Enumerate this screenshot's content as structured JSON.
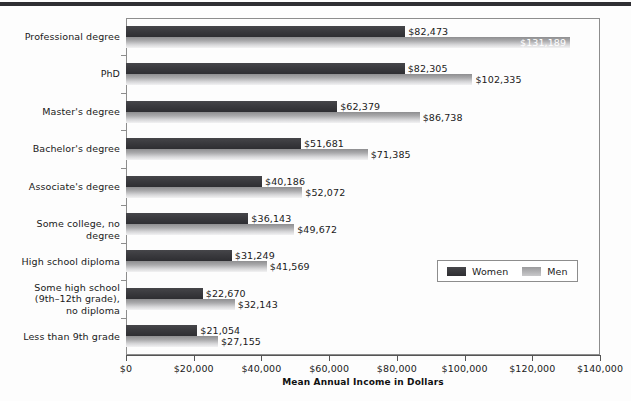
{
  "chart_data": {
    "type": "bar",
    "orientation": "horizontal",
    "title": "",
    "xlabel": "Mean Annual Income in Dollars",
    "ylabel": "",
    "xlim": [
      0,
      140000
    ],
    "xticks": [
      0,
      20000,
      40000,
      60000,
      80000,
      100000,
      120000,
      140000
    ],
    "xtick_labels": [
      "$0",
      "$20,000",
      "$40,000",
      "$60,000",
      "$80,000",
      "$100,000",
      "$120,000",
      "$140,000"
    ],
    "grid": false,
    "legend_position": "inside-lower-right",
    "categories": [
      "Professional degree",
      "PhD",
      "Master's degree",
      "Bachelor's degree",
      "Associate's degree",
      "Some college, no degree",
      "High school diploma",
      "Some high school (9th–12th grade), no diploma",
      "Less than 9th grade"
    ],
    "category_label_lines": [
      [
        "Professional degree"
      ],
      [
        "PhD"
      ],
      [
        "Master's degree"
      ],
      [
        "Bachelor's degree"
      ],
      [
        "Associate's degree"
      ],
      [
        "Some college, no degree"
      ],
      [
        "High school diploma"
      ],
      [
        "Some high school",
        "(9th–12th grade),",
        "no diploma"
      ],
      [
        "Less than 9th grade"
      ]
    ],
    "series": [
      {
        "name": "Women",
        "color": "#3a3a3e",
        "values": [
          82473,
          82305,
          62379,
          51681,
          40186,
          36143,
          31249,
          22670,
          21054
        ],
        "data_labels": [
          "$82,473",
          "$82,305",
          "$62,379",
          "$51,681",
          "$40,186",
          "$36,143",
          "$31,249",
          "$22,670",
          "$21,054"
        ]
      },
      {
        "name": "Men",
        "color": "#b4b4b6",
        "values": [
          131189,
          102335,
          86738,
          71385,
          52072,
          49672,
          41569,
          32143,
          27155
        ],
        "data_labels": [
          "$131,189",
          "$102,335",
          "$86,738",
          "$71,385",
          "$52,072",
          "$49,672",
          "$41,569",
          "$32,143",
          "$27,155"
        ],
        "label_inside": [
          true,
          false,
          false,
          false,
          false,
          false,
          false,
          false,
          false
        ]
      }
    ]
  },
  "legend": {
    "items": [
      {
        "label": "Women"
      },
      {
        "label": "Men"
      }
    ]
  },
  "axis": {
    "title": "Mean Annual Income in Dollars"
  }
}
